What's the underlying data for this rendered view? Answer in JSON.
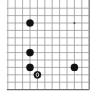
{
  "board": {
    "description": "Go board fragment (bottom-right region), 12x12 visible intersections",
    "columns": 12,
    "rows": 12,
    "origin_x": 7.8,
    "origin_y": 8.2,
    "step_x": 7.4,
    "step_y": 7.4,
    "open_edges": [
      "top",
      "left"
    ],
    "closed_edges": [
      "right",
      "bottom"
    ],
    "colors": {
      "background": "#ffffff",
      "grid_line": "#9a9a9a",
      "edge_line": "#6e6e6e",
      "black_stone": "#111111",
      "marker": "#ffffff",
      "star_point": "#555555"
    }
  },
  "star_points": [
    {
      "col": 9,
      "row": 2
    }
  ],
  "stones": [
    {
      "color": "black",
      "col": 3,
      "row": 2
    },
    {
      "color": "black",
      "col": 3,
      "row": 6
    },
    {
      "color": "black",
      "col": 3,
      "row": 8
    },
    {
      "color": "black",
      "col": 4,
      "row": 9,
      "marker": "0"
    },
    {
      "color": "black",
      "col": 9,
      "row": 8
    }
  ]
}
